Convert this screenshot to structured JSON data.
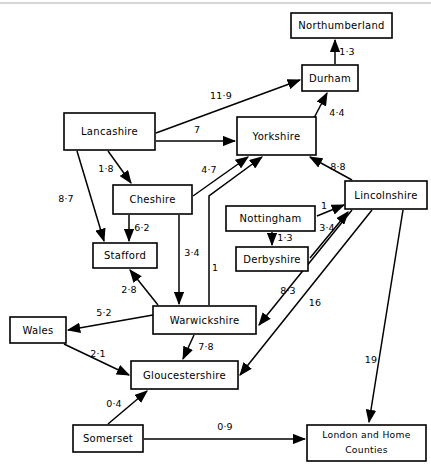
{
  "diagram": {
    "type": "directed-flow-diagram",
    "title": "",
    "canvas": {
      "width": 431,
      "height": 470
    },
    "nodes": [
      {
        "id": "northumberland",
        "label": "Northumberland",
        "x": 291,
        "y": 13,
        "w": 101,
        "h": 25
      },
      {
        "id": "durham",
        "label": "Durham",
        "x": 302,
        "y": 65,
        "w": 56,
        "h": 26
      },
      {
        "id": "lancashire",
        "label": "Lancashire",
        "x": 64,
        "y": 113,
        "w": 91,
        "h": 37
      },
      {
        "id": "yorkshire",
        "label": "Yorkshire",
        "x": 237,
        "y": 117,
        "w": 79,
        "h": 38
      },
      {
        "id": "cheshire",
        "label": "Cheshire",
        "x": 113,
        "y": 185,
        "w": 79,
        "h": 29
      },
      {
        "id": "lincolnshire",
        "label": "Lincolnshire",
        "x": 345,
        "y": 181,
        "w": 82,
        "h": 28
      },
      {
        "id": "nottingham",
        "label": "Nottingham",
        "x": 226,
        "y": 206,
        "w": 89,
        "h": 25
      },
      {
        "id": "derbyshire",
        "label": "Derbyshire",
        "x": 236,
        "y": 247,
        "w": 72,
        "h": 24
      },
      {
        "id": "stafford",
        "label": "Stafford",
        "x": 93,
        "y": 243,
        "w": 64,
        "h": 25
      },
      {
        "id": "warwickshire",
        "label": "Warwickshire",
        "x": 153,
        "y": 306,
        "w": 103,
        "h": 28
      },
      {
        "id": "wales",
        "label": "Wales",
        "x": 10,
        "y": 317,
        "w": 56,
        "h": 26
      },
      {
        "id": "gloucestershire",
        "label": "Gloucestershire",
        "x": 131,
        "y": 361,
        "w": 107,
        "h": 28
      },
      {
        "id": "somerset",
        "label": "Somerset",
        "x": 73,
        "y": 425,
        "w": 70,
        "h": 27
      },
      {
        "id": "london",
        "label": "London and Home\nCounties",
        "line1": "London and Home",
        "line2": "Counties",
        "x": 307,
        "y": 425,
        "w": 119,
        "h": 36
      }
    ],
    "edges": [
      {
        "id": "durham-northumberland",
        "from": "durham",
        "to": "northumberland",
        "label": "1·3",
        "x1": 335,
        "y1": 64,
        "x2": 335,
        "y2": 40,
        "lx": 347,
        "ly": 52
      },
      {
        "id": "lancashire-durham",
        "from": "lancashire",
        "to": "durham",
        "label": "11·9",
        "x1": 156,
        "y1": 133,
        "x2": 300,
        "y2": 80,
        "lx": 221,
        "ly": 96
      },
      {
        "id": "lancashire-yorkshire",
        "from": "lancashire",
        "to": "yorkshire",
        "label": "7",
        "x1": 156,
        "y1": 141,
        "x2": 235,
        "y2": 141,
        "lx": 197,
        "ly": 130
      },
      {
        "id": "yorkshire-durham",
        "from": "yorkshire",
        "to": "durham",
        "label": "4·4",
        "x1": 314,
        "y1": 118,
        "x2": 327,
        "y2": 93,
        "lx": 337,
        "ly": 113
      },
      {
        "id": "lancashire-cheshire",
        "from": "lancashire",
        "to": "cheshire",
        "label": "1·8",
        "x1": 108,
        "y1": 151,
        "x2": 131,
        "y2": 183,
        "lx": 106,
        "ly": 169
      },
      {
        "id": "lancashire-stafford",
        "from": "lancashire",
        "to": "stafford",
        "label": "8·7",
        "x1": 77,
        "y1": 151,
        "x2": 104,
        "y2": 241,
        "lx": 66,
        "ly": 199
      },
      {
        "id": "cheshire-yorkshire",
        "from": "cheshire",
        "to": "yorkshire",
        "label": "4·7",
        "x1": 193,
        "y1": 196,
        "x2": 248,
        "y2": 157,
        "lx": 209,
        "ly": 170
      },
      {
        "id": "lincolnshire-yorkshire",
        "from": "lincolnshire",
        "to": "yorkshire",
        "label": "8·8",
        "x1": 352,
        "y1": 180,
        "x2": 310,
        "y2": 157,
        "lx": 338,
        "ly": 167
      },
      {
        "id": "cheshire-stafford",
        "from": "cheshire",
        "to": "stafford",
        "label": "6·2",
        "x1": 129,
        "y1": 215,
        "x2": 129,
        "y2": 241,
        "lx": 142,
        "ly": 228
      },
      {
        "id": "cheshire-warwickshire",
        "from": "cheshire",
        "to": "warwickshire",
        "label": "3·4",
        "x1": 179,
        "y1": 215,
        "x2": 179,
        "y2": 304,
        "lx": 192,
        "ly": 253
      },
      {
        "id": "warwickshire-yorkshire",
        "from": "warwickshire",
        "to": "yorkshire",
        "label": "1",
        "x1": 209,
        "y1": 305,
        "x2": 209,
        "y2": 158,
        "lx": 215,
        "ly": 268,
        "elbow": {
          "x": 209,
          "y": 196,
          "tx": 262,
          "ty": 157
        }
      },
      {
        "id": "nottingham-lincolnshire",
        "from": "nottingham",
        "to": "lincolnshire",
        "label": "1",
        "x1": 317,
        "y1": 216,
        "x2": 344,
        "y2": 205,
        "lx": 324,
        "ly": 206
      },
      {
        "id": "derbyshire-lincolnshire",
        "from": "derbyshire",
        "to": "lincolnshire",
        "label": "3·4",
        "x1": 310,
        "y1": 258,
        "x2": 348,
        "y2": 212,
        "lx": 327,
        "ly": 228
      },
      {
        "id": "nottingham-derbyshire",
        "from": "nottingham",
        "to": "derbyshire",
        "label": "1·3",
        "x1": 272,
        "y1": 232,
        "x2": 272,
        "y2": 245,
        "lx": 285,
        "ly": 238
      },
      {
        "id": "stafford-warwickshire",
        "from": "warwickshire",
        "to": "stafford",
        "label": "2·8",
        "x1": 158,
        "y1": 305,
        "x2": 130,
        "y2": 270,
        "lx": 129,
        "ly": 290
      },
      {
        "id": "lincolnshire-warwickshire",
        "from": "lincolnshire",
        "to": "warwickshire",
        "label": "8·3",
        "x1": 352,
        "y1": 210,
        "x2": 259,
        "y2": 325,
        "lx": 288,
        "ly": 291
      },
      {
        "id": "lincolnshire-gloucestershire",
        "from": "lincolnshire",
        "to": "gloucestershire",
        "label": "16",
        "x1": 372,
        "y1": 210,
        "x2": 240,
        "y2": 375,
        "lx": 315,
        "ly": 303
      },
      {
        "id": "lincolnshire-london",
        "from": "lincolnshire",
        "to": "london",
        "label": "19",
        "x1": 403,
        "y1": 210,
        "x2": 369,
        "y2": 422,
        "lx": 371,
        "ly": 360
      },
      {
        "id": "warwickshire-wales",
        "from": "warwickshire",
        "to": "wales",
        "label": "5·2",
        "x1": 153,
        "y1": 315,
        "x2": 68,
        "y2": 330,
        "lx": 104,
        "ly": 313
      },
      {
        "id": "warwickshire-gloucestershire",
        "from": "warwickshire",
        "to": "gloucestershire",
        "label": "7·8",
        "x1": 194,
        "y1": 335,
        "x2": 183,
        "y2": 359,
        "lx": 206,
        "ly": 347
      },
      {
        "id": "wales-gloucestershire",
        "from": "wales",
        "to": "gloucestershire",
        "label": "2·1",
        "x1": 64,
        "y1": 344,
        "x2": 129,
        "y2": 375,
        "lx": 98,
        "ly": 354
      },
      {
        "id": "somerset-gloucestershire",
        "from": "somerset",
        "to": "gloucestershire",
        "label": "0·4",
        "x1": 108,
        "y1": 424,
        "x2": 147,
        "y2": 391,
        "lx": 114,
        "ly": 404
      },
      {
        "id": "somerset-london",
        "from": "somerset",
        "to": "london",
        "label": "0·9",
        "x1": 144,
        "y1": 439,
        "x2": 305,
        "y2": 439,
        "lx": 225,
        "ly": 427
      }
    ]
  }
}
